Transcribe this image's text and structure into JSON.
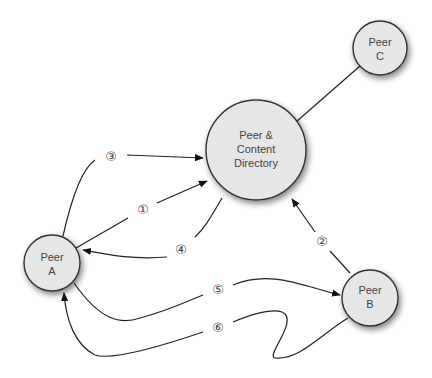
{
  "diagram": {
    "nodes": {
      "directory": {
        "line1": "Peer &",
        "line2": "Content",
        "line3": "Directory"
      },
      "peer_a": {
        "line1": "Peer",
        "line2": "A"
      },
      "peer_b": {
        "line1": "Peer",
        "line2": "B"
      },
      "peer_c": {
        "line1": "Peer",
        "line2": "C"
      }
    },
    "steps": {
      "s1": "①",
      "s2": "②",
      "s3": "③",
      "s4": "④",
      "s5": "⑤",
      "s6": "⑥"
    },
    "colors": {
      "node_fill": "#e6e6e6",
      "stroke": "#222222",
      "text": "#444444"
    }
  }
}
